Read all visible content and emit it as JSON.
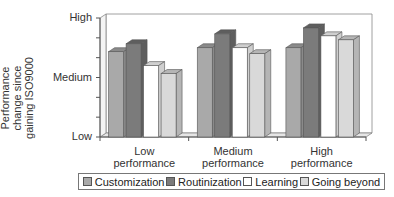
{
  "chart_data": {
    "type": "bar",
    "subtype": "3d-clustered-column",
    "title": "",
    "ylabel": "Performance change since gaining ISO9000",
    "xlabel": "",
    "categories": [
      "Low performance",
      "Medium performance",
      "High performance"
    ],
    "category_lines": [
      [
        "Low",
        "performance"
      ],
      [
        "Medium",
        "performance"
      ],
      [
        "High",
        "performance"
      ]
    ],
    "y_ticks": [
      "Low",
      "Medium",
      "High"
    ],
    "ylim": [
      0,
      6
    ],
    "y_tick_values": [
      0,
      3,
      6
    ],
    "minor_ticks": 6,
    "grid": false,
    "legend_position": "bottom",
    "series": [
      {
        "name": "Customization",
        "color": "#a9a9a9",
        "side": "#8a8a8a",
        "values": [
          4.3,
          4.5,
          4.5
        ]
      },
      {
        "name": "Routinization",
        "color": "#7b7b7b",
        "side": "#5e5e5e",
        "values": [
          4.7,
          5.2,
          5.5
        ]
      },
      {
        "name": "Learning",
        "color": "#ffffff",
        "side": "#cfcfcf",
        "values": [
          3.6,
          4.5,
          5.1
        ]
      },
      {
        "name": "Going beyond",
        "color": "#d9d9d9",
        "side": "#b5b5b5",
        "values": [
          3.2,
          4.2,
          4.9
        ]
      }
    ]
  }
}
